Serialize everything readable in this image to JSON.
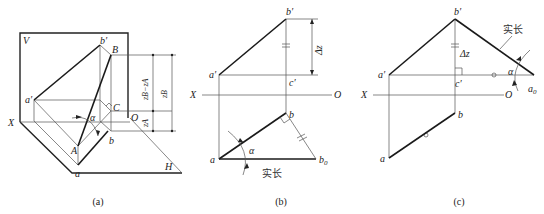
{
  "figure": {
    "panels": [
      {
        "caption": "(a)",
        "labels": {
          "V": "V",
          "H": "H",
          "X": "X",
          "O": "O",
          "a_prime": "a′",
          "b_prime": "b′",
          "A": "A",
          "B": "B",
          "C": "C",
          "a": "a",
          "b": "b",
          "alpha": "α",
          "dim_zb_minus_za": "zB−zA",
          "dim_zb": "zB",
          "dim_za": "zA"
        }
      },
      {
        "caption": "(b)",
        "labels": {
          "X": "X",
          "O": "O",
          "a_prime": "a′",
          "b_prime": "b′",
          "c_prime": "c′",
          "a": "a",
          "b": "b",
          "b0": "b",
          "b0_sub": "0",
          "alpha": "α",
          "delta_z": "Δz",
          "true_length": "实长"
        }
      },
      {
        "caption": "(c)",
        "labels": {
          "X": "X",
          "O": "O",
          "a_prime": "a′",
          "b_prime": "b′",
          "c_prime": "c′",
          "a": "a",
          "b": "b",
          "a0": "a",
          "a0_sub": "0",
          "alpha": "α",
          "delta_z": "Δz",
          "true_length": "实长"
        }
      }
    ]
  }
}
